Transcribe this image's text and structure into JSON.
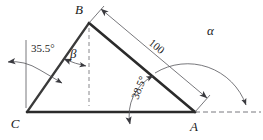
{
  "figure": {
    "type": "geometry-diagram",
    "background_color": "#ffffff",
    "line_color": "#2b2b2b",
    "thin_line_color": "#55555b"
  },
  "vertices": [
    {
      "name": "B",
      "label": "B",
      "x": 89,
      "y": 23,
      "label_x": 79,
      "label_y": 14
    },
    {
      "name": "C",
      "label": "C",
      "x": 27,
      "y": 112,
      "label_x": 15,
      "label_y": 128
    },
    {
      "name": "A",
      "label": "A",
      "x": 195,
      "y": 112,
      "label_x": 192,
      "label_y": 130
    }
  ],
  "edges": [
    {
      "name": "edge-CB",
      "from": "C",
      "to": "B"
    },
    {
      "name": "edge-BA",
      "from": "B",
      "to": "A"
    },
    {
      "name": "edge-CA",
      "from": "C",
      "to": "A"
    }
  ],
  "angles": [
    {
      "name": "angle-35-5",
      "label": "35.5°",
      "value": 35.5,
      "unit": "degrees",
      "at": "C-vertical-reference",
      "text_x": 31,
      "text_y": 52,
      "rotation": 0
    },
    {
      "name": "angle-beta",
      "label": "β",
      "symbol": "beta",
      "at": "B",
      "text_x": 73,
      "text_y": 58,
      "rotation": 0
    },
    {
      "name": "angle-38-5",
      "label": "38.5°",
      "value": 38.5,
      "unit": "degrees",
      "at": "A",
      "text_x": 138,
      "text_y": 100,
      "rotation": -69
    },
    {
      "name": "angle-alpha",
      "label": "α",
      "symbol": "alpha",
      "at": "A-exterior",
      "text_x": 210,
      "text_y": 35,
      "rotation": 0
    }
  ],
  "dimensions": [
    {
      "name": "dimension-100",
      "label": "100",
      "value": 100,
      "from": "B",
      "to": "A",
      "text_x": 150,
      "text_y": 46,
      "rotation": 39
    }
  ],
  "reference_lines": [
    {
      "name": "vertical-reference-at-C",
      "style": "solid-thin"
    },
    {
      "name": "vertical-dashed-from-B",
      "style": "dashed"
    },
    {
      "name": "horizontal-dashed-from-A",
      "style": "dashed"
    }
  ]
}
